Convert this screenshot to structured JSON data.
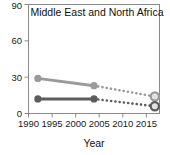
{
  "chart_data": {
    "type": "line",
    "title": "Middle East and North Africa",
    "xlabel": "Year",
    "ylabel": "",
    "xlim": [
      1988,
      2016
    ],
    "ylim": [
      0,
      90
    ],
    "xticks": [
      1990,
      1995,
      2000,
      2005,
      2010,
      2015
    ],
    "yticks": [
      0,
      30,
      60,
      90
    ],
    "xtick_labels": [
      "1990",
      "1995",
      "2000",
      "2005",
      "2010",
      "2015"
    ],
    "ytick_labels": [
      "0",
      "30",
      "60",
      "90"
    ],
    "grid": false,
    "legend": "none",
    "series": [
      {
        "name": "upper-series",
        "color": "#9a9a9a",
        "solid_segment": {
          "x": [
            1990,
            2002
          ],
          "y": [
            29,
            23
          ]
        },
        "dotted_segment": {
          "x": [
            2002,
            2015
          ],
          "y": [
            23,
            14
          ]
        },
        "markers": [
          {
            "x": 1990,
            "y": 29,
            "style": "filled"
          },
          {
            "x": 2002,
            "y": 23,
            "style": "filled"
          },
          {
            "x": 2015,
            "y": 14,
            "style": "open-ring"
          }
        ]
      },
      {
        "name": "lower-series",
        "color": "#5c5c5c",
        "solid_segment": {
          "x": [
            1990,
            2002
          ],
          "y": [
            12,
            12
          ]
        },
        "dotted_segment": {
          "x": [
            2002,
            2015
          ],
          "y": [
            12,
            6
          ]
        },
        "markers": [
          {
            "x": 1990,
            "y": 12,
            "style": "filled"
          },
          {
            "x": 2002,
            "y": 12,
            "style": "filled"
          },
          {
            "x": 2015,
            "y": 6,
            "style": "open-ring"
          }
        ]
      }
    ]
  },
  "axes": {
    "frame_color": "#808080",
    "tick_color": "#808080",
    "text_color": "#1a1a1a"
  },
  "labels": {
    "title": "Middle East and North Africa",
    "x_axis_title": "Year",
    "y_0": "0",
    "y_30": "30",
    "y_60": "60",
    "y_90": "90",
    "x_1990": "1990",
    "x_1995": "1995",
    "x_2000": "2000",
    "x_2005": "2005",
    "x_2010": "2010",
    "x_2015": "2015"
  }
}
